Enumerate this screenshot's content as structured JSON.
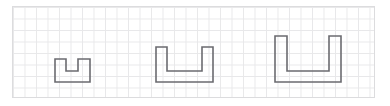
{
  "canvas": {
    "width": 390,
    "height": 106,
    "background_color": "#ffffff",
    "title": "Three U-shaped figures on grid paper"
  },
  "grid": {
    "name": "graph-paper-grid",
    "left": 12,
    "top": 6,
    "width": 363,
    "height": 92,
    "cell_size": 11.5,
    "line_color": "#e8e8ea",
    "border_color": "#dcdcde",
    "columns": 31,
    "rows": 8,
    "background_color": "#ffffff"
  },
  "shapes": {
    "stroke_color": "#6b6b70",
    "stroke_width": 1.6,
    "fill": "none",
    "items": [
      {
        "id": "shape-small",
        "label": "small-u-shape",
        "description": "U shape, 3 cells wide, 2 cells tall, 1-cell-wide notch 1 cell deep",
        "width_cells": 3,
        "height_cells": 2,
        "notch_width_cells": 1,
        "notch_depth_cells": 1,
        "points": "55,59 66,59 66,71 78,71 78,59 90,59 90,82 55,82"
      },
      {
        "id": "shape-medium",
        "label": "medium-u-shape",
        "description": "U shape, 5 cells wide, 3 cells tall, 3-cell-wide notch 2 cells deep",
        "width_cells": 5,
        "height_cells": 3,
        "notch_width_cells": 3,
        "notch_depth_cells": 2,
        "points": "156,47 167,47 167,71 202,71 202,47 213,47 213,82 156,82"
      },
      {
        "id": "shape-large",
        "label": "large-u-shape",
        "description": "U shape, 6 cells wide, 4 cells tall, 4-cell-wide notch 3 cells deep",
        "width_cells": 6,
        "height_cells": 4,
        "notch_width_cells": 4,
        "notch_depth_cells": 3,
        "points": "275,36 287,36 287,71 329,71 329,36 341,36 341,82 275,82"
      }
    ]
  }
}
